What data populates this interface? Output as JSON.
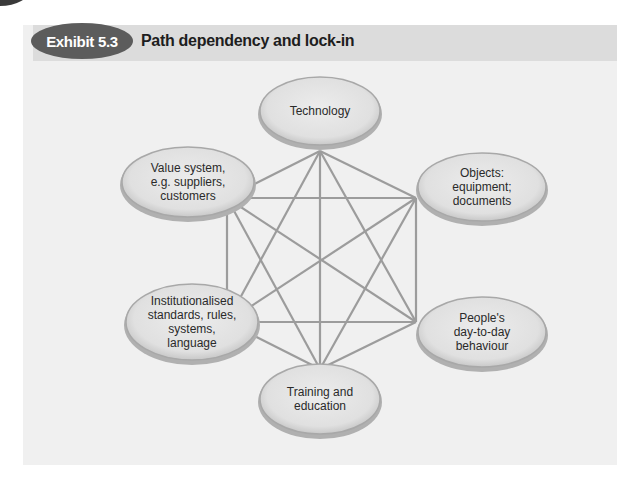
{
  "exhibit": {
    "badge": "Exhibit 5.3",
    "title": "Path dependency and lock-in"
  },
  "colors": {
    "badge_bg": "#5c5c5c",
    "header_band": "#dcdcdc",
    "panel_bg": "#f0f0f0",
    "node_fill": "#e4e4e4",
    "node_rim": "#9a9a9a",
    "connector": "#9c9c9c"
  },
  "nodes": [
    {
      "id": "technology",
      "lines": [
        "Technology"
      ]
    },
    {
      "id": "objects",
      "lines": [
        "Objects:",
        "equipment;",
        "documents"
      ]
    },
    {
      "id": "behaviour",
      "lines": [
        "People's",
        "day-to-day",
        "behaviour"
      ]
    },
    {
      "id": "training",
      "lines": [
        "Training and",
        "education"
      ]
    },
    {
      "id": "institutions",
      "lines": [
        "Institutionalised",
        "standards, rules,",
        "systems,",
        "language"
      ]
    },
    {
      "id": "value-system",
      "lines": [
        "Value system,",
        "e.g. suppliers,",
        "customers"
      ]
    }
  ],
  "connections": "fully-connected hexagon: every node linked to every other node"
}
